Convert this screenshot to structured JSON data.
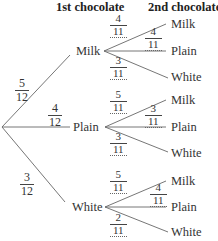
{
  "headers": {
    "first": "1st chocolate",
    "second": "2nd chocolate"
  },
  "first_level": [
    {
      "label": "Milk",
      "prob": {
        "num": "5",
        "den": "12"
      }
    },
    {
      "label": "Plain",
      "prob": {
        "num": "4",
        "den": "12"
      }
    },
    {
      "label": "White",
      "prob": {
        "num": "3",
        "den": "12"
      }
    }
  ],
  "second_level": {
    "milk": [
      {
        "label": "Milk",
        "prob": {
          "num": "4",
          "den": "11"
        }
      },
      {
        "label": "Plain",
        "prob": {
          "num": "4",
          "den": "11"
        }
      },
      {
        "label": "White",
        "prob": {
          "num": "3",
          "den": "11"
        }
      }
    ],
    "plain": [
      {
        "label": "Milk",
        "prob": {
          "num": "5",
          "den": "11"
        }
      },
      {
        "label": "Plain",
        "prob": {
          "num": "3",
          "den": "11"
        }
      },
      {
        "label": "White",
        "prob": {
          "num": "3",
          "den": "11"
        }
      }
    ],
    "white": [
      {
        "label": "Milk",
        "prob": {
          "num": "5",
          "den": "11"
        }
      },
      {
        "label": "Plain",
        "prob": {
          "num": "4",
          "den": "11"
        }
      },
      {
        "label": "White",
        "prob": {
          "num": "2",
          "den": "11"
        }
      }
    ]
  },
  "colors": {
    "line": "#555555",
    "text": "#333333"
  }
}
